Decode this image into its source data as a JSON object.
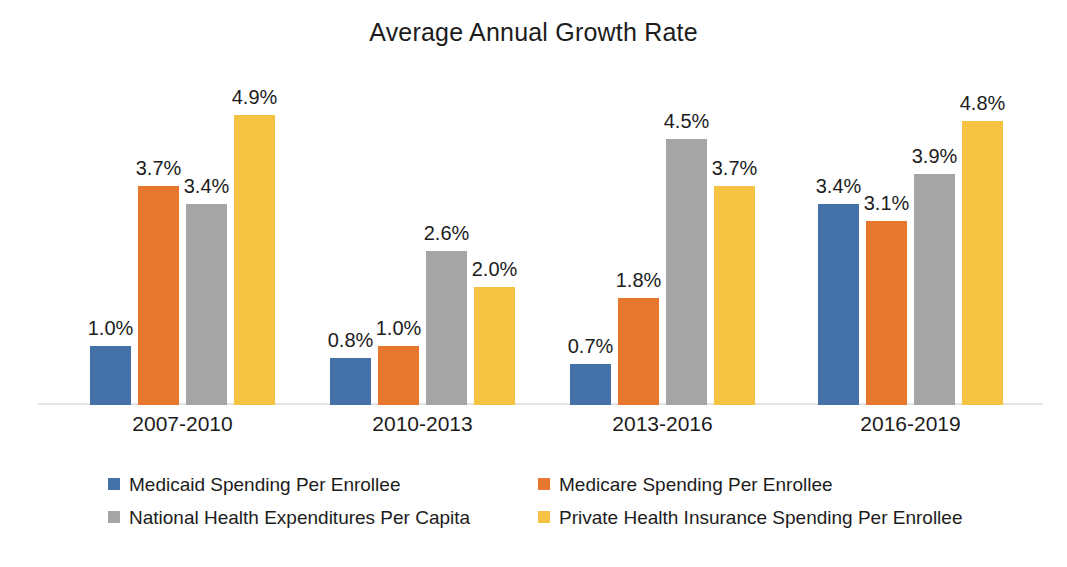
{
  "chart_data": {
    "type": "bar",
    "title": "Average Annual Growth Rate",
    "xlabel": "",
    "ylabel": "",
    "ylim": [
      0,
      5.2
    ],
    "grid": false,
    "legend_position": "bottom",
    "value_suffix": "%",
    "categories": [
      "2007-2010",
      "2010-2013",
      "2013-2016",
      "2016-2019"
    ],
    "series": [
      {
        "name": "Medicaid Spending Per Enrollee",
        "color": "#4472A8",
        "values": [
          1.0,
          0.8,
          0.7,
          3.4
        ],
        "labels": [
          "1.0%",
          "0.8%",
          "0.7%",
          "3.4%"
        ]
      },
      {
        "name": "Medicare Spending Per Enrollee",
        "color": "#E8772E",
        "values": [
          3.7,
          1.0,
          1.8,
          3.1
        ],
        "labels": [
          "3.7%",
          "1.0%",
          "1.8%",
          "3.1%"
        ]
      },
      {
        "name": "National Health Expenditures Per Capita",
        "color": "#A5A5A5",
        "values": [
          3.4,
          2.6,
          4.5,
          3.9
        ],
        "labels": [
          "3.4%",
          "2.6%",
          "4.5%",
          "3.9%"
        ]
      },
      {
        "name": "Private Health Insurance Spending Per Enrollee",
        "color": "#F5C242",
        "values": [
          4.9,
          2.0,
          3.7,
          4.8
        ],
        "labels": [
          "4.9%",
          "2.0%",
          "3.7%",
          "4.8%"
        ]
      }
    ]
  },
  "legend": {
    "entries": [
      {
        "label": "Medicaid Spending Per Enrollee",
        "color": "#4472A8"
      },
      {
        "label": "Medicare Spending Per Enrollee",
        "color": "#E8772E"
      },
      {
        "label": "National Health Expenditures Per Capita",
        "color": "#A5A5A5"
      },
      {
        "label": "Private Health Insurance Spending Per Enrollee",
        "color": "#F5C242"
      }
    ]
  },
  "colors": {
    "background": "#ffffff",
    "text": "#1c1c1c",
    "axis_line": "#e4e4e4",
    "medicaid_blue": "#4472A8",
    "medicare_orange": "#E8772E",
    "national_gray": "#A5A5A5",
    "private_yellow": "#F5C242"
  }
}
